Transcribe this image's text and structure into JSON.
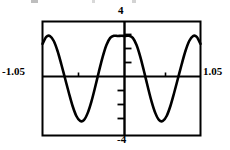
{
  "figure": {
    "name": "graphing-calculator-plot",
    "background": "#ffffff",
    "ink": "#000000"
  },
  "window_labels": {
    "ymax": "4",
    "ymin": "-4",
    "xmin": "-1.05",
    "xmax": "1.05"
  },
  "chart_data": {
    "type": "line",
    "title": "",
    "xlabel": "",
    "ylabel": "",
    "xlim": [
      -1.05,
      1.05
    ],
    "ylim": [
      -4,
      4
    ],
    "grid": false,
    "legend": false,
    "axis_style": "calculator-window",
    "xtick_values": [
      -0.525,
      0.525
    ],
    "ytick_values": [
      -3,
      -2,
      -1,
      1,
      2,
      3
    ],
    "tick_labels_shown": false,
    "series": [
      {
        "name": "cosine-wave",
        "description": "cosine-like oscillation, maximum at x=0",
        "amplitude": 3.0,
        "periods_visible": 2.0,
        "x": [
          -1.05,
          -1.0,
          -0.95,
          -0.9,
          -0.85,
          -0.8,
          -0.75,
          -0.7,
          -0.65,
          -0.6,
          -0.55,
          -0.5,
          -0.45,
          -0.4,
          -0.35,
          -0.3,
          -0.25,
          -0.2,
          -0.15,
          -0.1,
          -0.05,
          0.0,
          0.05,
          0.1,
          0.15,
          0.2,
          0.25,
          0.3,
          0.35,
          0.4,
          0.45,
          0.5,
          0.55,
          0.6,
          0.65,
          0.7,
          0.75,
          0.8,
          0.85,
          0.9,
          0.95,
          1.0,
          1.05
        ],
        "y": [
          2.43,
          2.92,
          2.98,
          2.63,
          1.93,
          1.0,
          0.0,
          -1.0,
          -1.93,
          -2.63,
          -2.98,
          -2.92,
          -2.43,
          -1.62,
          -0.6,
          0.49,
          1.52,
          2.35,
          2.85,
          3.0,
          2.98,
          3.0,
          2.98,
          3.0,
          2.85,
          2.35,
          1.52,
          0.49,
          -0.6,
          -1.62,
          -2.43,
          -2.92,
          -2.98,
          -2.63,
          -1.93,
          -1.0,
          0.0,
          1.0,
          1.93,
          2.63,
          2.98,
          2.92,
          2.43
        ]
      }
    ]
  }
}
